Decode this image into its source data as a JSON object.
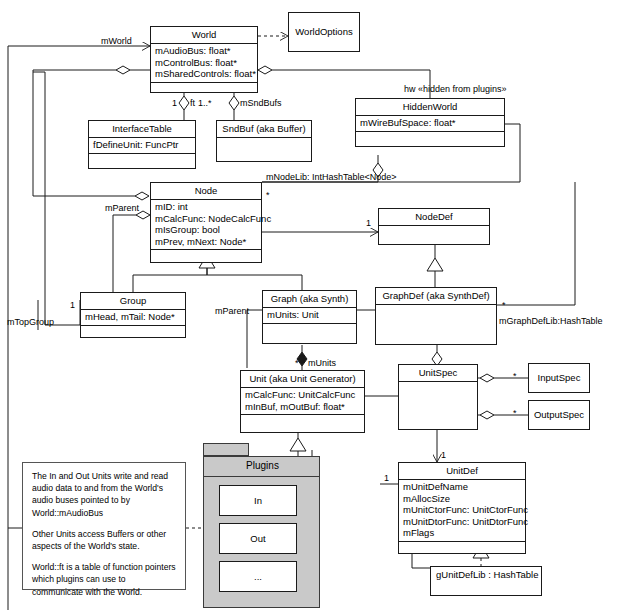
{
  "diagram": {
    "classes": {
      "world": {
        "name": "World",
        "attrs": [
          "mAudioBus: float*",
          "mControlBus: float*",
          "mSharedControls: float*"
        ]
      },
      "world_options": {
        "name": "WorldOptions"
      },
      "hidden_world": {
        "name": "HiddenWorld",
        "attrs": [
          "mWireBufSpace: float*"
        ]
      },
      "interface_table": {
        "name": "InterfaceTable",
        "attrs": [
          "fDefineUnit: FuncPtr"
        ]
      },
      "snd_buf": {
        "name": "SndBuf (aka Buffer)"
      },
      "node": {
        "name": "Node",
        "attrs": [
          "mID: int",
          "mCalcFunc: NodeCalcFunc",
          "mIsGroup: bool",
          "mPrev, mNext: Node*"
        ]
      },
      "node_def": {
        "name": "NodeDef"
      },
      "group": {
        "name": "Group",
        "attrs": [
          "mHead, mTail: Node*"
        ]
      },
      "graph": {
        "name": "Graph (aka Synth)",
        "attrs": [
          "mUnits: Unit"
        ]
      },
      "graph_def": {
        "name": "GraphDef (aka SynthDef)"
      },
      "unit": {
        "name": "Unit (aka Unit Generator)",
        "attrs": [
          "mCalcFunc: UnitCalcFunc",
          "mInBuf, mOutBuf: float*"
        ]
      },
      "unit_spec": {
        "name": "UnitSpec"
      },
      "input_spec": {
        "name": "InputSpec"
      },
      "output_spec": {
        "name": "OutputSpec"
      },
      "unit_def": {
        "name": "UnitDef",
        "attrs": [
          "mUnitDefName",
          "mAllocSize",
          "mUnitCtorFunc: UnitCtorFunc",
          "mUnitDtorFunc: UnitDtorFunc",
          "mFlags"
        ]
      },
      "unit_def_lib": {
        "name": "gUnitDefLib : HashTable"
      }
    },
    "package": {
      "name": "Plugins",
      "members": [
        {
          "name": "In"
        },
        {
          "name": "Out"
        },
        {
          "name": "..."
        }
      ]
    },
    "edge_labels": {
      "m_world": "mWorld",
      "ft_mult": "1",
      "ft_role": "ft",
      "sndbufs_mult": "1..*",
      "sndbufs_role": "mSndBufs",
      "hidden_world": "hw «hidden from plugins»",
      "node_lib": "mNodeLib: IntHashTable<Node>",
      "node_lib_mult": "*",
      "node_def_mult": "1",
      "m_parent_node": "mParent",
      "m_top_group_mult": "1",
      "m_top_group": "mTopGroup",
      "m_parent_graph": "mParent",
      "graph_def_lib_mult": "*",
      "graph_def_lib": "mGraphDefLib:HashTable",
      "m_units_mult": "*",
      "m_units": "mUnits",
      "input_spec_mult": "*",
      "output_spec_mult": "*",
      "unit_def_mult": "1",
      "unit_def_left_mult": "1"
    },
    "note": {
      "paragraphs": [
        "The In and Out Units write and read audio data to and from the World's  audio buses pointed  to by World::mAudioBus",
        "Other Units access Buffers or other aspects of the World's state.",
        "World::ft is a table of function pointers which plugins can use to communicate with the World."
      ]
    },
    "colors": {
      "line": "#1a1a1a",
      "package_fill": "#c9c9c9",
      "background": "#ffffff"
    }
  }
}
